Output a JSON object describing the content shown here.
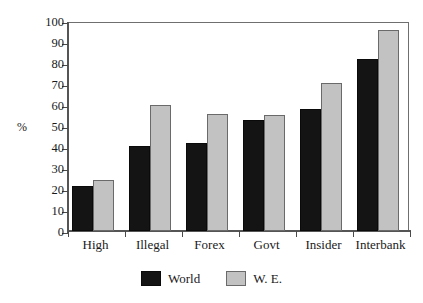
{
  "chart_data": {
    "type": "bar",
    "title": "",
    "subtitle": "",
    "xlabel": "",
    "ylabel": "%",
    "ylim": [
      0,
      100
    ],
    "ytick_step": 10,
    "yticks": [
      "100",
      "90",
      "80",
      "70",
      "60",
      "50",
      "40",
      "30",
      "20",
      "10",
      "0"
    ],
    "grid": false,
    "legend_position": "bottom-center",
    "categories": [
      "High",
      "Illegal",
      "Forex",
      "Govt",
      "Insider",
      "Interbank"
    ],
    "series": [
      {
        "name": "World",
        "color": "#141414",
        "values": [
          21.5,
          40.5,
          42,
          53,
          58,
          82
        ]
      },
      {
        "name": "W. E.",
        "color": "#c2c2c2",
        "values": [
          24.5,
          60,
          55.5,
          55,
          70.5,
          95.5
        ]
      }
    ]
  },
  "axis": {
    "y_title": "%"
  },
  "legend": {
    "entries": [
      {
        "label": "World",
        "swatch": "black-square-swatch"
      },
      {
        "label": "W. E.",
        "swatch": "gray-square-swatch"
      }
    ]
  }
}
